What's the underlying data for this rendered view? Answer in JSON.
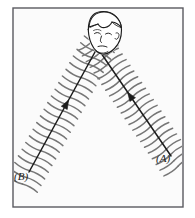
{
  "figure": {
    "background_color": "#ffffff",
    "panel_fill": "#fbfbfb",
    "frame": {
      "color": "#5a5a60",
      "x": 13,
      "y": 8,
      "width": 170,
      "height": 199,
      "stroke_width": 1.4
    },
    "ink_color": "#1d1d1d",
    "hatch_color": "#767676",
    "arrows": [
      {
        "id": "arrow-a",
        "label": "(A)",
        "label_x": 156,
        "label_y": 162,
        "tail_x": 171,
        "tail_y": 156,
        "head_x": 101,
        "head_y": 53,
        "arrowhead_t": 0.62,
        "hatch_count": 22,
        "hatch_half_length": 17,
        "direction": "up-left"
      },
      {
        "id": "arrow-b",
        "label": "(B)",
        "label_x": 14,
        "label_y": 180,
        "tail_x": 29,
        "tail_y": 172,
        "head_x": 95,
        "head_y": 52,
        "arrowhead_t": 0.6,
        "hatch_count": 22,
        "hatch_half_length": 17,
        "direction": "up-right"
      }
    ],
    "head": {
      "name": "child-head",
      "center_x": 104,
      "center_y": 32,
      "radius_x": 17,
      "radius_y": 20,
      "description": "Line-drawn child's head with short hair, facing down-left"
    }
  }
}
